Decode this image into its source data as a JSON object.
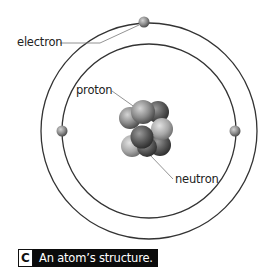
{
  "figure": {
    "labels": {
      "electron": "electron",
      "proton": "proton",
      "neutron": "neutron"
    },
    "caption": {
      "letter": "C",
      "text": "An atom’s structure."
    },
    "colors": {
      "orbit": "#333333",
      "leader_line": "#888888",
      "caption_bg": "#0b0b0b",
      "caption_text": "#ffffff",
      "particle_light": "#c8c8c8",
      "particle_dark": "#4a4a4a"
    },
    "structure": {
      "orbits": 2,
      "electrons": 3,
      "nucleus_particles": "cluster of protons and neutrons"
    }
  }
}
